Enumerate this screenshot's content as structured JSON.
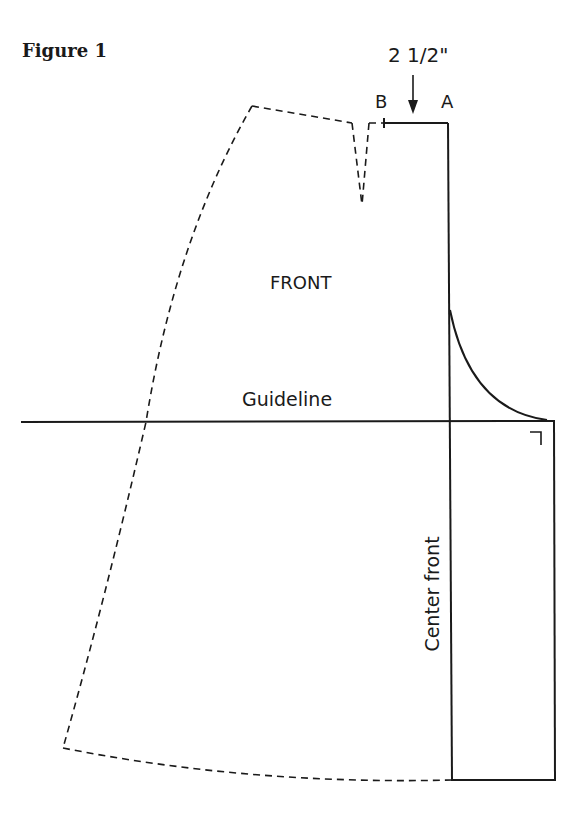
{
  "figure": {
    "title": "Figure 1",
    "labels": {
      "measurement": "2 1/2\"",
      "point_b": "B",
      "point_a": "A",
      "front": "FRONT",
      "guideline": "Guideline",
      "center_front": "Center front"
    },
    "colors": {
      "line": "#1a1a1a",
      "background": "#ffffff"
    },
    "elements": {
      "dashed_outline": "side seam, waist and hem (dashed)",
      "dart": "waist dart (dashed)",
      "solid_outline": "center front extension (solid)",
      "arrow": "down-arrow indicating 2 1/2 inch measurement",
      "right_angle_mark": "square corner marker"
    }
  }
}
